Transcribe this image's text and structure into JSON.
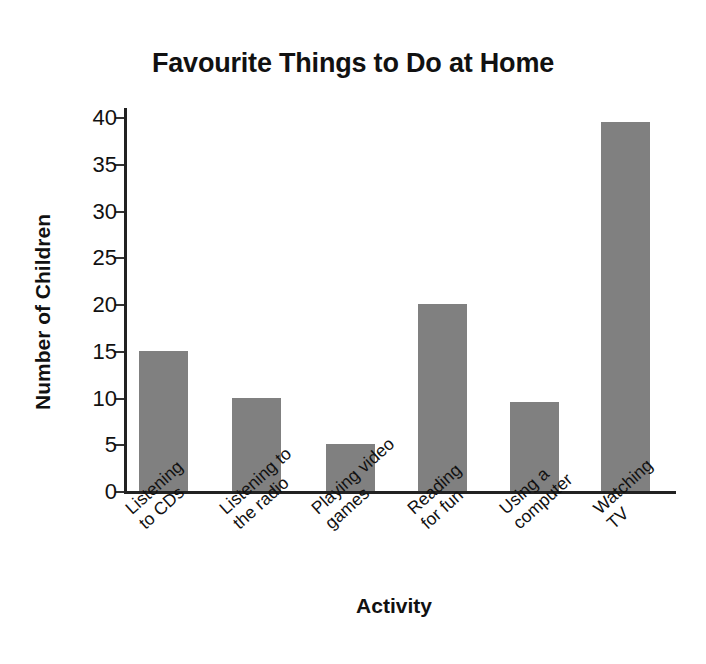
{
  "chart_data": {
    "type": "bar",
    "title": "Favourite Things to Do at Home",
    "xlabel": "Activity",
    "ylabel": "Number of Children",
    "categories": [
      "Listening\nto CDs",
      "Listening to\nthe radio",
      "Playing video\ngames",
      "Reading\nfor fun",
      "Using a\ncomputer",
      "Watching TV"
    ],
    "values": [
      15,
      10,
      5,
      20,
      9.5,
      39.5
    ],
    "ylim": [
      0,
      41
    ],
    "yticks": [
      0,
      5,
      10,
      15,
      20,
      25,
      30,
      35,
      40
    ],
    "ytick_labels": [
      "0",
      "5",
      "10",
      "15",
      "20",
      "25",
      "30",
      "35",
      "40"
    ],
    "grid": false,
    "legend": false,
    "bar_color": "#808080",
    "axis_color": "#222222",
    "background_color": "#ffffff"
  }
}
